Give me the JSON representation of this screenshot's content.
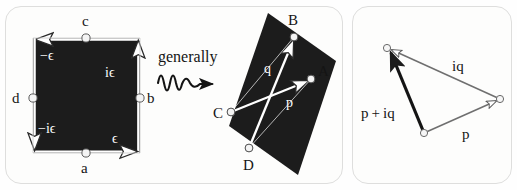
{
  "figure": {
    "background_color": "#fefefe",
    "panel_border_color": "#dededd",
    "fill_color": "#1c1c1c",
    "stroke_white": "#ffffff",
    "stroke_gray": "#6f6f6f",
    "stroke_dark": "#141414"
  },
  "panel_left": {
    "name": "square-panel",
    "shape": "square",
    "vertex_dots": [
      {
        "id": "c",
        "label": "c",
        "x": 86,
        "y": 38,
        "label_x": 82,
        "label_y": 26
      },
      {
        "id": "b",
        "label": "b",
        "x": 140,
        "y": 98,
        "label_x": 147,
        "label_y": 103
      },
      {
        "id": "a",
        "label": "a",
        "x": 86,
        "y": 153,
        "label_x": 81,
        "label_y": 173
      },
      {
        "id": "d",
        "label": "d",
        "x": 33,
        "y": 98,
        "label_x": 12,
        "label_y": 103
      }
    ],
    "edge_labels": [
      {
        "id": "minus-epsilon",
        "text": "−ϵ",
        "x": 40,
        "y": 60
      },
      {
        "id": "i-epsilon",
        "text": "iϵ",
        "x": 105,
        "y": 77
      },
      {
        "id": "minus-i-epsilon",
        "text": "−iϵ",
        "x": 38,
        "y": 133
      },
      {
        "id": "epsilon",
        "text": "ϵ",
        "x": 112,
        "y": 143
      }
    ]
  },
  "transition": {
    "name": "generally-arrow",
    "label": "generally",
    "label_x": 158,
    "label_y": 62,
    "squiggle_description": "wavy-arrow-right"
  },
  "panel_mid": {
    "name": "parallelogram-panel",
    "shape": "parallelogram",
    "vertex_dots": [
      {
        "id": "B",
        "label": "B",
        "x": 294,
        "y": 37,
        "label_x": 288,
        "label_y": 25
      },
      {
        "id": "A",
        "label": "A",
        "x": 311,
        "y": 79,
        "label_x": 318,
        "label_y": 76
      },
      {
        "id": "C",
        "label": "C",
        "x": 231,
        "y": 112,
        "label_x": 213,
        "label_y": 118
      },
      {
        "id": "D",
        "label": "D",
        "x": 249,
        "y": 148,
        "label_x": 243,
        "label_y": 170
      }
    ],
    "vector_labels": [
      {
        "id": "q",
        "text": "q",
        "x": 264,
        "y": 73
      },
      {
        "id": "p",
        "text": "p",
        "x": 286,
        "y": 107
      }
    ]
  },
  "panel_right": {
    "name": "triangle-panel",
    "shape": "triangle",
    "vertex_dots": [
      {
        "id": "tip",
        "x": 387,
        "y": 48
      },
      {
        "id": "origin",
        "x": 424,
        "y": 133
      },
      {
        "id": "mid",
        "x": 500,
        "y": 99
      }
    ],
    "vector_labels": [
      {
        "id": "iq",
        "text": "iq",
        "x": 452,
        "y": 71
      },
      {
        "id": "p-plus-iq",
        "text": "p + iq",
        "x": 361,
        "y": 118
      },
      {
        "id": "p",
        "text": "p",
        "x": 462,
        "y": 139
      }
    ]
  }
}
